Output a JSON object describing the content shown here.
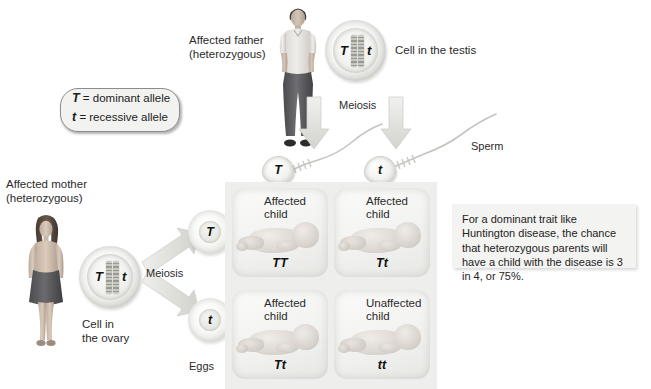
{
  "diagram": {
    "background": "#ffffff",
    "panel_color": "#eeeeec"
  },
  "legend": {
    "dominant_symbol": "T",
    "dominant_text": "= dominant allele",
    "recessive_symbol": "t",
    "recessive_text": "= recessive allele"
  },
  "father": {
    "label": "Affected father\n(heterozygous)",
    "cell_label": "Cell in the testis",
    "cell_alleles": [
      "T",
      "t"
    ],
    "meiosis_label": "Meiosis",
    "gametes_label": "Sperm",
    "gametes": [
      "T",
      "t"
    ]
  },
  "mother": {
    "label": "Affected mother\n(heterozygous)",
    "cell_label": "Cell in\nthe ovary",
    "cell_alleles": [
      "T",
      "t"
    ],
    "meiosis_label": "Meiosis",
    "gametes_label": "Eggs",
    "gametes": [
      "T",
      "t"
    ]
  },
  "offspring": [
    {
      "status": "Affected\nchild",
      "genotype": "TT"
    },
    {
      "status": "Affected\nchild",
      "genotype": "Tt"
    },
    {
      "status": "Affected\nchild",
      "genotype": "Tt"
    },
    {
      "status": "Unaffected\nchild",
      "genotype": "tt"
    }
  ],
  "callout": {
    "text": "For a dominant trait like Huntington disease, the chance that heterozygous parents will have a child with the disease is 3 in 4, or 75%."
  }
}
